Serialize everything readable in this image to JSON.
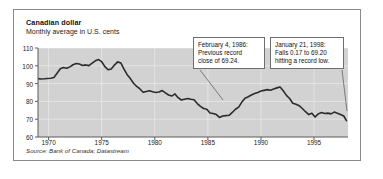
{
  "figure": {
    "title": "Canadian dollar",
    "subtitle": "Monthly average in U.S. cents",
    "source": "Source: Bank of Canada; Datastream"
  },
  "annotations": [
    {
      "name": "annotation-1986",
      "lines": [
        "February 4, 1986:",
        "Previous record",
        "close of 69.24."
      ]
    },
    {
      "name": "annotation-1998",
      "lines": [
        "January 21, 1998:",
        "Falls 0.17 to 69.20",
        "hitting a record low."
      ]
    }
  ],
  "colors": {
    "plot_background": "#d2d2d2",
    "grid": "#e9e9e9",
    "series_line": "#2b2b2b",
    "axis": "#5a5a5a",
    "card_border": "#8a8a8a",
    "page_background": "#ffffff"
  },
  "chart_data": {
    "type": "line",
    "title": "Canadian dollar",
    "subtitle": "Monthly average in U.S. cents",
    "xlabel": "",
    "ylabel": "U.S. cents",
    "xlim": [
      1969,
      1998.2
    ],
    "ylim": [
      60,
      110
    ],
    "yticks": [
      60,
      70,
      80,
      90,
      100,
      110
    ],
    "xticks": [
      1970,
      1975,
      1980,
      1985,
      1990,
      1995
    ],
    "grid": true,
    "legend": "none",
    "series": [
      {
        "name": "Canadian dollar (monthly average, U.S. cents)",
        "x": [
          1969.0,
          1969.3,
          1969.6,
          1969.9,
          1970.2,
          1970.5,
          1970.8,
          1971.1,
          1971.4,
          1971.7,
          1972.0,
          1972.3,
          1972.6,
          1972.9,
          1973.2,
          1973.5,
          1973.8,
          1974.1,
          1974.4,
          1974.7,
          1975.0,
          1975.3,
          1975.6,
          1975.9,
          1976.2,
          1976.5,
          1976.8,
          1977.1,
          1977.4,
          1977.7,
          1978.0,
          1978.3,
          1978.6,
          1978.9,
          1979.2,
          1979.5,
          1979.8,
          1980.1,
          1980.4,
          1980.7,
          1981.0,
          1981.3,
          1981.6,
          1981.9,
          1982.2,
          1982.5,
          1982.8,
          1983.1,
          1983.4,
          1983.7,
          1984.0,
          1984.3,
          1984.6,
          1984.9,
          1985.2,
          1985.5,
          1985.8,
          1986.1,
          1986.4,
          1986.7,
          1987.0,
          1987.3,
          1987.6,
          1987.9,
          1988.2,
          1988.5,
          1988.8,
          1989.1,
          1989.4,
          1989.7,
          1990.0,
          1990.3,
          1990.6,
          1990.9,
          1991.2,
          1991.5,
          1991.8,
          1992.1,
          1992.4,
          1992.7,
          1993.0,
          1993.3,
          1993.6,
          1993.9,
          1994.2,
          1994.5,
          1994.8,
          1995.1,
          1995.4,
          1995.7,
          1996.0,
          1996.3,
          1996.6,
          1996.9,
          1997.2,
          1997.5,
          1997.8,
          1998.05
        ],
        "y": [
          92.8,
          92.6,
          92.7,
          92.9,
          93.0,
          93.4,
          95.8,
          98.3,
          99.0,
          98.6,
          99.4,
          100.6,
          101.3,
          101.0,
          100.2,
          100.5,
          100.1,
          101.5,
          102.8,
          103.5,
          102.3,
          99.5,
          97.8,
          98.2,
          100.4,
          102.2,
          101.6,
          98.1,
          95.0,
          92.8,
          90.2,
          88.4,
          87.0,
          85.1,
          85.6,
          86.0,
          85.4,
          85.0,
          85.3,
          86.1,
          84.8,
          83.6,
          83.0,
          84.2,
          82.1,
          80.8,
          81.2,
          81.6,
          81.2,
          80.9,
          78.8,
          77.2,
          76.0,
          75.6,
          73.5,
          73.2,
          72.6,
          71.0,
          71.8,
          72.0,
          72.2,
          73.8,
          75.6,
          76.8,
          79.6,
          81.8,
          82.6,
          83.6,
          84.4,
          85.0,
          85.8,
          86.2,
          86.6,
          86.3,
          87.0,
          87.6,
          88.1,
          86.0,
          83.4,
          81.6,
          79.0,
          78.4,
          77.6,
          76.0,
          74.2,
          72.6,
          73.4,
          71.2,
          73.0,
          73.8,
          73.2,
          73.4,
          73.0,
          74.0,
          73.4,
          72.6,
          71.8,
          69.2
        ]
      }
    ],
    "annotated_points": [
      {
        "label": "February 4, 1986: Previous record close of 69.24.",
        "x": 1986.1,
        "y": 71.0
      },
      {
        "label": "January 21, 1998: Falls 0.17 to 69.20 hitting a record low.",
        "x": 1998.05,
        "y": 69.2
      }
    ]
  }
}
